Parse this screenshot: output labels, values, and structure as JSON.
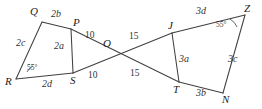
{
  "figure": {
    "type": "geometry-diagram",
    "stroke_color": "#404040",
    "background_color": "#ffffff",
    "vertices": [
      {
        "id": "Q",
        "label": "Q",
        "x": 42,
        "y": 22
      },
      {
        "id": "P",
        "label": "P",
        "x": 71,
        "y": 29
      },
      {
        "id": "R",
        "label": "R",
        "x": 16,
        "y": 79
      },
      {
        "id": "S",
        "label": "S",
        "x": 73,
        "y": 73
      },
      {
        "id": "O",
        "label": "O",
        "x": 108,
        "y": 49
      },
      {
        "id": "J",
        "label": "J",
        "x": 172,
        "y": 33
      },
      {
        "id": "T",
        "label": "T",
        "x": 179,
        "y": 82
      },
      {
        "id": "Z",
        "label": "Z",
        "x": 245,
        "y": 15
      },
      {
        "id": "N",
        "label": "N",
        "x": 223,
        "y": 93
      }
    ],
    "vertex_labels": [
      {
        "text": "Q",
        "x": 30,
        "y": 6
      },
      {
        "text": "P",
        "x": 73,
        "y": 17
      },
      {
        "text": "R",
        "x": 5,
        "y": 76
      },
      {
        "text": "S",
        "x": 70,
        "y": 75
      },
      {
        "text": "O",
        "x": 103,
        "y": 38
      },
      {
        "text": "J",
        "x": 168,
        "y": 20
      },
      {
        "text": "T",
        "x": 173,
        "y": 84
      },
      {
        "text": "Z",
        "x": 244,
        "y": 3
      },
      {
        "text": "N",
        "x": 222,
        "y": 94
      }
    ],
    "segment_labels": [
      {
        "text": "2b",
        "x": 51,
        "y": 9,
        "kind": "seg"
      },
      {
        "text": "2c",
        "x": 16,
        "y": 38,
        "kind": "seg"
      },
      {
        "text": "2a",
        "x": 54,
        "y": 41,
        "kind": "seg"
      },
      {
        "text": "2d",
        "x": 42,
        "y": 79,
        "kind": "seg"
      },
      {
        "text": "3a",
        "x": 179,
        "y": 54,
        "kind": "seg"
      },
      {
        "text": "3b",
        "x": 196,
        "y": 88,
        "kind": "seg"
      },
      {
        "text": "3c",
        "x": 228,
        "y": 54,
        "kind": "seg"
      },
      {
        "text": "3d",
        "x": 196,
        "y": 6,
        "kind": "seg"
      }
    ],
    "length_labels": [
      {
        "text": "10",
        "x": 85,
        "y": 31,
        "kind": "num"
      },
      {
        "text": "10",
        "x": 88,
        "y": 71,
        "kind": "num"
      },
      {
        "text": "15",
        "x": 129,
        "y": 32,
        "kind": "num"
      },
      {
        "text": "15",
        "x": 130,
        "y": 69,
        "kind": "num"
      }
    ],
    "angle_labels": [
      {
        "text": "55°",
        "x": 27,
        "y": 64,
        "kind": "ang"
      },
      {
        "text": "55°",
        "x": 216,
        "y": 21,
        "kind": "ang"
      }
    ],
    "edges": [
      {
        "from": "Q",
        "to": "P",
        "name": "edge-q-p"
      },
      {
        "from": "Q",
        "to": "R",
        "name": "edge-q-r"
      },
      {
        "from": "R",
        "to": "S",
        "name": "edge-r-s"
      },
      {
        "from": "P",
        "to": "S",
        "name": "edge-p-s"
      },
      {
        "from": "P",
        "to": "T",
        "name": "edge-p-o-t"
      },
      {
        "from": "S",
        "to": "J",
        "name": "edge-s-o-j"
      },
      {
        "from": "J",
        "to": "Z",
        "name": "edge-j-z"
      },
      {
        "from": "J",
        "to": "T",
        "name": "edge-j-t"
      },
      {
        "from": "T",
        "to": "N",
        "name": "edge-t-n"
      },
      {
        "from": "Z",
        "to": "N",
        "name": "edge-z-n"
      }
    ]
  }
}
